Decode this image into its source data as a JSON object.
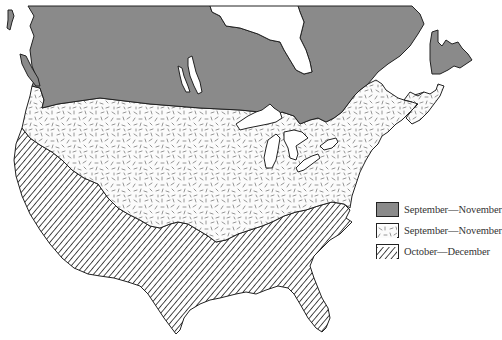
{
  "map": {
    "title": "",
    "region": "North America (Canada and United States)",
    "colors": {
      "background": "#ffffff",
      "zone1_fill": "#8a8a8a",
      "zone2_fill": "#fbfbfb",
      "zone2_dash": "#777777",
      "zone3_stripe": "#444444",
      "outline": "#222222"
    },
    "zones": [
      {
        "id": "north",
        "pattern": "solid-gray",
        "period": "September—November"
      },
      {
        "id": "middle",
        "pattern": "random-dashes",
        "period": "September—November"
      },
      {
        "id": "south",
        "pattern": "diagonal-hatch",
        "period": "October—December"
      }
    ]
  },
  "legend": {
    "items": [
      {
        "swatch": "solid-gray",
        "label": "September—November"
      },
      {
        "swatch": "random-dashes",
        "label": "September—November"
      },
      {
        "swatch": "diagonal-hatch",
        "label": "October—December"
      }
    ]
  }
}
